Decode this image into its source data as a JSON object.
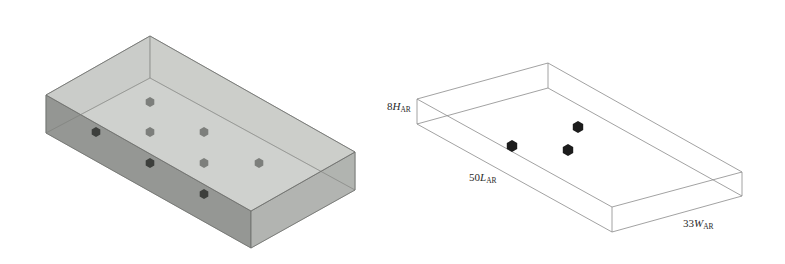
{
  "figure": {
    "left_panel": {
      "description": "Shaded 3D box with 9 cube markers arranged in a grid",
      "colors": {
        "top_face": "#c9cbc8",
        "front_face": "#8f918e",
        "side_face": "#b2b4b1",
        "edge": "#6d6f6c",
        "marker_light": "#7d7f7c",
        "marker_dark": "#3d3f3c"
      },
      "markers": [
        {
          "x": 150,
          "y": 102,
          "tone": "light"
        },
        {
          "x": 150,
          "y": 132,
          "tone": "light"
        },
        {
          "x": 204,
          "y": 132,
          "tone": "light"
        },
        {
          "x": 96,
          "y": 132,
          "tone": "dark"
        },
        {
          "x": 150,
          "y": 163,
          "tone": "dark"
        },
        {
          "x": 204,
          "y": 163,
          "tone": "light"
        },
        {
          "x": 259,
          "y": 163,
          "tone": "light"
        },
        {
          "x": 204,
          "y": 194,
          "tone": "dark"
        }
      ]
    },
    "right_panel": {
      "description": "Wireframe box with 3 dark cube markers",
      "colors": {
        "edge": "#8a8a8a",
        "marker": "#1c1c1c"
      },
      "labels": {
        "height": {
          "coef": "8",
          "var": "H",
          "sub": "AR"
        },
        "length": {
          "coef": "50",
          "var": "L",
          "sub": "AR"
        },
        "width": {
          "coef": "33",
          "var": "W",
          "sub": "AR"
        }
      },
      "markers": [
        {
          "x": 512,
          "y": 146
        },
        {
          "x": 578,
          "y": 127
        },
        {
          "x": 568,
          "y": 150
        }
      ]
    }
  }
}
